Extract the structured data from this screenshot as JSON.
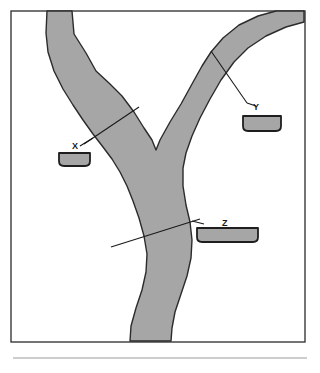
{
  "figure": {
    "title": "",
    "caption": "",
    "background_color": "#ffffff",
    "frame": {
      "name": "diagram-frame",
      "x": 11,
      "y": 11,
      "width": 294,
      "height": 331,
      "stroke_color": "#3a3a3a",
      "fill_color": "#ffffff",
      "stroke_width": 1.4
    },
    "footer_rule": {
      "name": "footer-rule",
      "x1": 13,
      "y1": 358,
      "x2": 307,
      "y2": 358,
      "stroke_color": "#bdbdbd",
      "stroke_width": 1.6
    }
  },
  "river": {
    "name": "river-channel",
    "fill_color": "#a6a6a6",
    "stroke_color": "#2b2b2b",
    "stroke_width": 1.4,
    "description": "Y-shaped river confluence: two tributaries joining into one main trunk",
    "path": "M 47 11 L 72 11 L 74 34 L 86 53 L 96 71 L 110 84 L 122 96 L 134 112 L 144 128 L 152 140 L 156 150 L 160 140 L 170 122 L 181 104 L 192 84 L 202 66 L 211 52 L 223 38 L 239 25 L 258 16 L 276 11 L 304 11 L 304 22 L 286 27 L 266 36 L 248 48 L 234 62 L 221 80 L 210 99 L 200 118 L 192 136 L 186 153 L 183 168 L 183 186 L 186 205 L 190 222 L 192 240 L 191 258 L 187 276 L 181 294 L 175 312 L 172 328 L 171 341 L 130 341 L 131 326 L 136 308 L 142 290 L 146 272 L 147 254 L 144 236 L 139 218 L 133 201 L 127 186 L 120 172 L 112 159 L 103 147 L 93 134 L 83 120 L 73 105 L 63 89 L 54 71 L 48 52 L 46 33 Z"
  },
  "transects": [
    {
      "name": "transect-x",
      "label": "X",
      "label_x": 72,
      "label_y": 149,
      "line": {
        "x1": 84,
        "y1": 144,
        "x2": 139,
        "y2": 107
      },
      "leader": {
        "x1": 80,
        "y1": 146,
        "x2": 93,
        "y2": 138
      },
      "stroke_color": "#1a1a1a",
      "stroke_width": 1.1,
      "cross_section": {
        "name": "cross-section-bar-x",
        "x": 59,
        "y": 153,
        "width": 31,
        "height": 13,
        "corner_radius": 5,
        "fill_color": "#a6a6a6",
        "stroke_color": "#1e1e1e",
        "stroke_width": 1.8
      }
    },
    {
      "name": "transect-y",
      "label": "Y",
      "label_x": 253,
      "label_y": 110,
      "line": {
        "x1": 211,
        "y1": 51,
        "x2": 247,
        "y2": 103
      },
      "leader": {
        "x1": 247,
        "y1": 103,
        "x2": 256,
        "y2": 106
      },
      "stroke_color": "#1a1a1a",
      "stroke_width": 1.1,
      "cross_section": {
        "name": "cross-section-bar-y",
        "x": 243,
        "y": 116,
        "width": 38,
        "height": 15,
        "corner_radius": 5,
        "fill_color": "#a6a6a6",
        "stroke_color": "#1e1e1e",
        "stroke_width": 1.8
      }
    },
    {
      "name": "transect-z",
      "label": "Z",
      "label_x": 222,
      "label_y": 226,
      "line": {
        "x1": 111,
        "y1": 247,
        "x2": 200,
        "y2": 219
      },
      "leader": {
        "x1": 192,
        "y1": 221,
        "x2": 204,
        "y2": 224
      },
      "stroke_color": "#1a1a1a",
      "stroke_width": 1.1,
      "cross_section": {
        "name": "cross-section-bar-z",
        "x": 197,
        "y": 228,
        "width": 61,
        "height": 14,
        "corner_radius": 5,
        "fill_color": "#a6a6a6",
        "stroke_color": "#1e1e1e",
        "stroke_width": 1.8
      }
    }
  ]
}
